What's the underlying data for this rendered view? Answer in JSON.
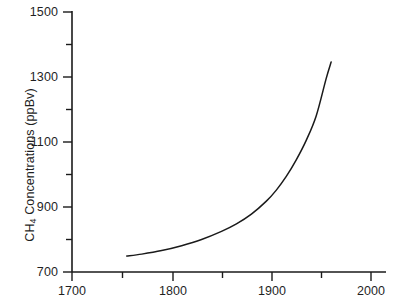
{
  "chart_data": {
    "type": "line",
    "title": "",
    "subtitle": "",
    "xlabel": "",
    "ylabel": "CH4 Concentrations (ppBv)",
    "ylabel_prefix": "CH",
    "ylabel_subscript": "4",
    "ylabel_suffix": " Concentrations (ppBv)",
    "xlim": [
      1700,
      2010
    ],
    "ylim": [
      700,
      1500
    ],
    "grid": false,
    "legend": null,
    "legend_position": "none",
    "line_color": "#1a1a1a",
    "axis_color": "#1a1a1a",
    "background_color": "#ffffff",
    "x_major_ticks": [
      1700,
      1800,
      1900,
      2000
    ],
    "x_minor_ticks": [
      1750,
      1850,
      1950
    ],
    "x_tick_labels": [
      "1700",
      "1800",
      "1900",
      "2000"
    ],
    "y_major_ticks": [
      700,
      900,
      1100,
      1300,
      1500
    ],
    "y_minor_ticks": [
      800,
      1000,
      1200,
      1400
    ],
    "y_tick_labels": [
      "700",
      "900",
      "1100",
      "1300",
      "1500"
    ],
    "series": [
      {
        "name": "CH4 concentration",
        "x": [
          1755,
          1770,
          1790,
          1810,
          1830,
          1850,
          1865,
          1880,
          1895,
          1905,
          1915,
          1925,
          1935,
          1945,
          1955,
          1960
        ],
        "y": [
          749,
          755,
          766,
          781,
          800,
          825,
          848,
          878,
          918,
          952,
          994,
          1045,
          1105,
          1180,
          1295,
          1346
        ]
      }
    ],
    "data_start_label": "1755",
    "data_end_label": "1960",
    "data_start_value": "749",
    "data_end_value": "1346"
  }
}
